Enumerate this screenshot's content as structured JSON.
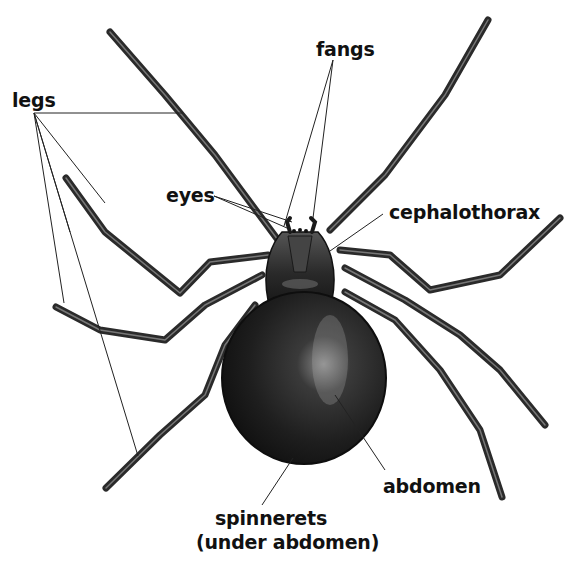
{
  "diagram": {
    "colors": {
      "background": "#ffffff",
      "ink": "#111111",
      "body_dark": "#1c1c1c",
      "body_mid": "#3a3a3a",
      "highlight": "#9a9a9a",
      "leader_line": "#222222"
    },
    "labels": [
      {
        "id": "legs",
        "text": "legs",
        "x": 12,
        "y": 92
      },
      {
        "id": "fangs",
        "text": "fangs",
        "x": 316,
        "y": 41
      },
      {
        "id": "eyes",
        "text": "eyes",
        "x": 168,
        "y": 186
      },
      {
        "id": "cephalothorax",
        "text": "cephalothorax",
        "x": 389,
        "y": 203
      },
      {
        "id": "abdomen",
        "text": "abdomen",
        "x": 383,
        "y": 477
      },
      {
        "id": "spinnerets",
        "line1": "spinnerets",
        "line2": "(under abdomen)",
        "x": 200,
        "y": 506
      }
    ],
    "leader_lines": {
      "legs": [
        [
          34,
          113,
          183,
          113
        ],
        [
          34,
          113,
          64,
          303
        ],
        [
          34,
          113,
          70,
          232
        ],
        [
          34,
          113,
          138,
          456
        ],
        [
          34,
          113,
          105,
          203
        ]
      ],
      "fangs": [
        [
          333,
          60,
          284,
          226
        ],
        [
          333,
          60,
          313,
          218
        ]
      ],
      "eyes": [
        [
          214,
          196,
          287,
          228
        ],
        [
          214,
          196,
          292,
          222
        ]
      ],
      "cephalothorax": [
        [
          383,
          214,
          330,
          251
        ]
      ],
      "abdomen": [
        [
          385,
          470,
          335,
          395
        ]
      ],
      "spinnerets": [
        [
          262,
          505,
          293,
          458
        ]
      ]
    }
  }
}
